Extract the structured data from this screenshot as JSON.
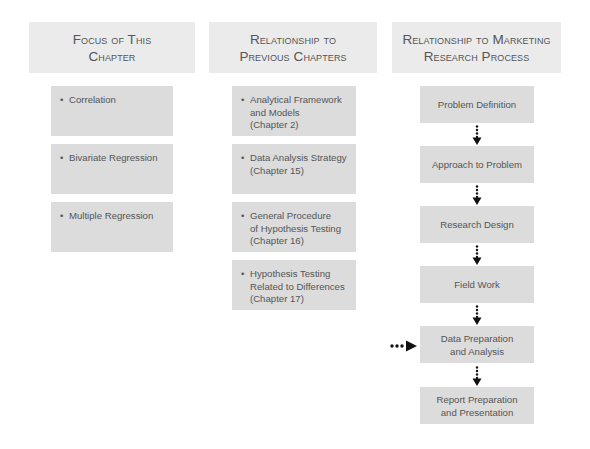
{
  "headers": {
    "focus": "Focus of This\nChapter",
    "previous": "Relationship to\nPrevious Chapters",
    "process": "Relationship to Marketing\nResearch Process"
  },
  "focus_items": [
    {
      "label": "Correlation"
    },
    {
      "label": "Bivariate Regression"
    },
    {
      "label": "Multiple Regression"
    }
  ],
  "previous_items": [
    {
      "label": "Analytical Framework\nand Models\n(Chapter 2)"
    },
    {
      "label": "Data Analysis Strategy\n(Chapter 15)"
    },
    {
      "label": "General Procedure\nof Hypothesis Testing\n(Chapter 16)"
    },
    {
      "label": "Hypothesis Testing\nRelated to Differences\n(Chapter 17)"
    }
  ],
  "process_steps": [
    {
      "label": "Problem Definition"
    },
    {
      "label": "Approach to Problem"
    },
    {
      "label": "Research Design"
    },
    {
      "label": "Field Work"
    },
    {
      "label": "Data Preparation\nand Analysis",
      "highlighted": true
    },
    {
      "label": "Report Preparation\nand Presentation"
    }
  ],
  "bullet_symbol": "•",
  "colors": {
    "header_bg": "#ebebeb",
    "box_bg": "#dcdcdc",
    "text": "#555555",
    "arrow": "#111111"
  }
}
